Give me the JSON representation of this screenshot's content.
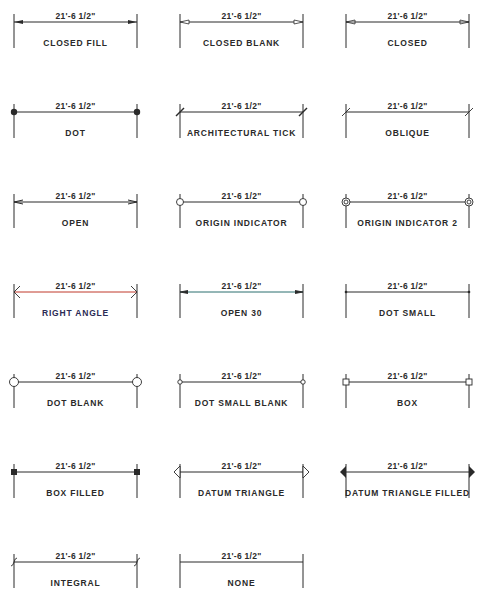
{
  "diagram": {
    "dimension_text": "21'-6 1/2\"",
    "colors": {
      "ink": "#2a2a2a",
      "right_angle_line": "#c0392b",
      "open30_line": "#2a6f6f",
      "right_angle_label": "#2b2b55"
    },
    "items": [
      {
        "label": "CLOSED FILL",
        "style": "closed-fill"
      },
      {
        "label": "CLOSED BLANK",
        "style": "closed-blank"
      },
      {
        "label": "CLOSED",
        "style": "closed"
      },
      {
        "label": "DOT",
        "style": "dot"
      },
      {
        "label": "ARCHITECTURAL TICK",
        "style": "arch-tick"
      },
      {
        "label": "OBLIQUE",
        "style": "oblique"
      },
      {
        "label": "OPEN",
        "style": "open"
      },
      {
        "label": "ORIGIN INDICATOR",
        "style": "origin"
      },
      {
        "label": "ORIGIN INDICATOR 2",
        "style": "origin2"
      },
      {
        "label": "RIGHT ANGLE",
        "style": "right-angle"
      },
      {
        "label": "OPEN 30",
        "style": "open30"
      },
      {
        "label": "DOT SMALL",
        "style": "dot-small"
      },
      {
        "label": "DOT BLANK",
        "style": "dot-blank"
      },
      {
        "label": "DOT SMALL BLANK",
        "style": "dot-small-blank"
      },
      {
        "label": "BOX",
        "style": "box"
      },
      {
        "label": "BOX FILLED",
        "style": "box-filled"
      },
      {
        "label": "DATUM TRIANGLE",
        "style": "datum"
      },
      {
        "label": "DATUM TRIANGLE FILLED",
        "style": "datum-filled"
      },
      {
        "label": "INTEGRAL",
        "style": "integral"
      },
      {
        "label": "NONE",
        "style": "none"
      }
    ]
  }
}
